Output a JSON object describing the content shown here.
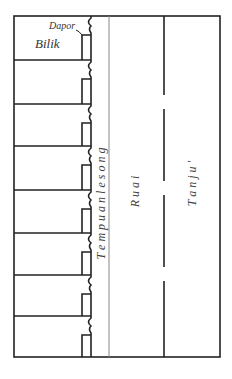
{
  "diagram": {
    "type": "floor-plan",
    "labels": {
      "dapor": "Dapor",
      "bilik": "Bilik",
      "tempuan": "T e m p u a n   l e s o n g",
      "ruai": "R u a i",
      "tanju": "T a n j u '"
    },
    "rooms": [
      {
        "name": "Bilik",
        "y0": 16,
        "y1": 60
      },
      {
        "name": "Bilik",
        "y0": 60,
        "y1": 104
      },
      {
        "name": "Bilik",
        "y0": 104,
        "y1": 146
      },
      {
        "name": "Bilik",
        "y0": 146,
        "y1": 190
      },
      {
        "name": "Bilik",
        "y0": 190,
        "y1": 233
      },
      {
        "name": "Bilik",
        "y0": 233,
        "y1": 275
      },
      {
        "name": "Bilik",
        "y0": 275,
        "y1": 316
      },
      {
        "name": "Bilik",
        "y0": 316,
        "y1": 357
      }
    ],
    "colors": {
      "line": "#222222",
      "thin_line": "#888888",
      "text": "#333333"
    }
  }
}
